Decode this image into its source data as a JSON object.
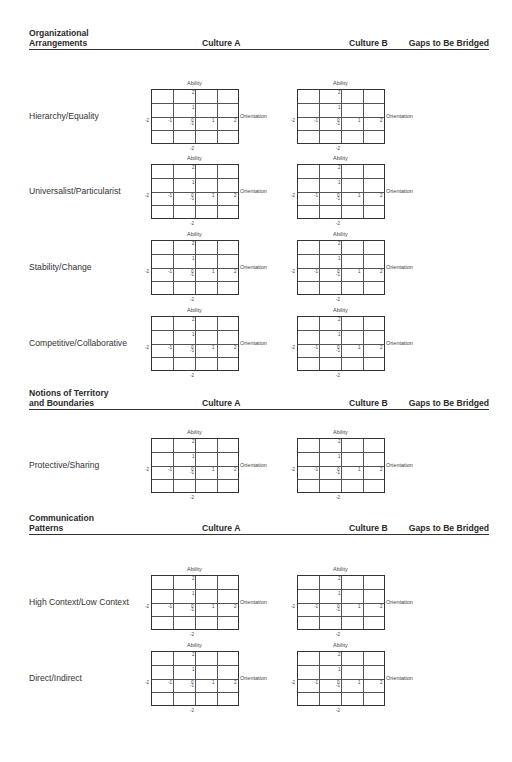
{
  "sections": [
    {
      "title_line1": "Organizational",
      "title_line2": "Arrangements",
      "col_a": "Culture A",
      "col_b": "Culture B",
      "col_gap": "Gaps to Be Bridged",
      "rows": [
        {
          "label": "Hierarchy/Equality"
        },
        {
          "label": "Universalist/Particularist"
        },
        {
          "label": "Stability/Change"
        },
        {
          "label": "Competitive/Collaborative"
        }
      ]
    },
    {
      "title_line1": "Notions of Territory",
      "title_line2": "and Boundaries",
      "col_a": "Culture A",
      "col_b": "Culture B",
      "col_gap": "Gaps to Be Bridged",
      "rows": [
        {
          "label": "Protective/Sharing"
        }
      ]
    },
    {
      "title_line1": "Communication",
      "title_line2": "Patterns",
      "col_a": "Culture A",
      "col_b": "Culture B",
      "col_gap": "Gaps to Be Bridged",
      "rows": [
        {
          "label": "High Context/Low Context"
        },
        {
          "label": "Direct/Indirect"
        }
      ]
    }
  ],
  "axis": {
    "y_label": "Ability",
    "x_label": "Orientation",
    "x_ticks": [
      "-2",
      "-1",
      "0",
      "1",
      "2"
    ],
    "y_ticks": [
      "2",
      "1",
      "-1",
      "-2"
    ]
  }
}
